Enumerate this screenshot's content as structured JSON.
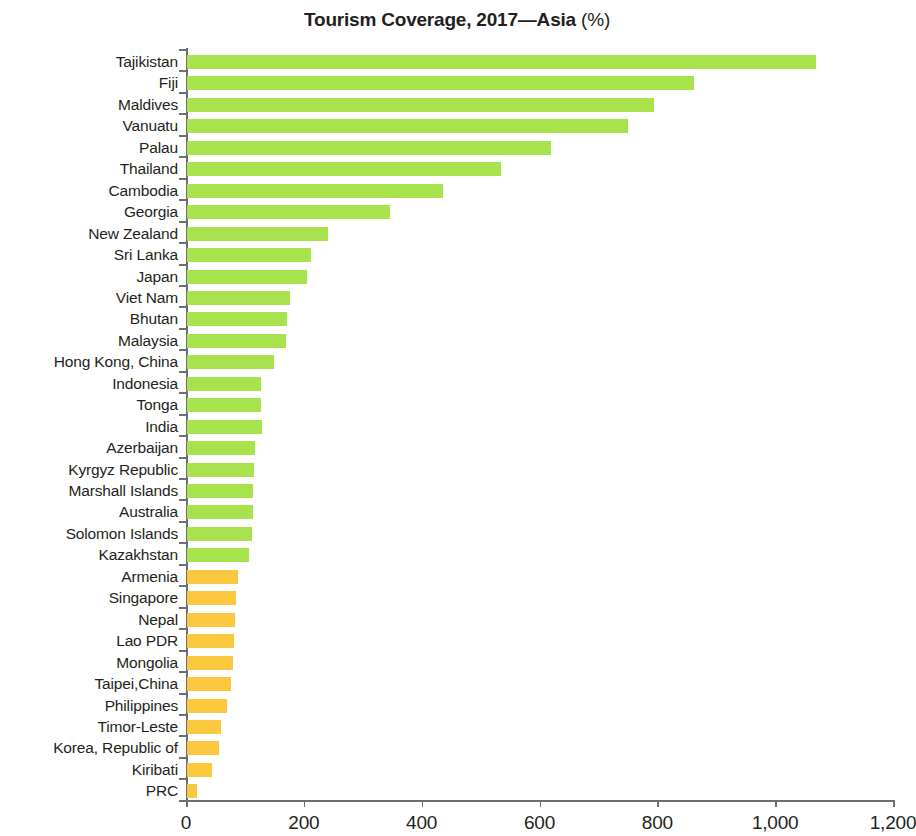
{
  "title": {
    "main": "Tourism Coverage, 2017—Asia",
    "unit": "(%)"
  },
  "colors": {
    "green": "#A8E24C",
    "orange": "#FBC73E",
    "axis": "#6D6E71",
    "text": "#231F20"
  },
  "axis": {
    "x_ticks": [
      "0",
      "200",
      "400",
      "600",
      "800",
      "1,000",
      "1,200"
    ]
  },
  "chart_data": {
    "type": "bar",
    "orientation": "horizontal",
    "title": "Tourism Coverage, 2017—Asia (%)",
    "xlabel": "",
    "ylabel": "",
    "xlim": [
      0,
      1200
    ],
    "xticks": [
      0,
      200,
      400,
      600,
      800,
      1000,
      1200
    ],
    "grid": false,
    "legend": "none",
    "categories": [
      "Tajikistan",
      "Fiji",
      "Maldives",
      "Vanuatu",
      "Palau",
      "Thailand",
      "Cambodia",
      "Georgia",
      "New Zealand",
      "Sri Lanka",
      "Japan",
      "Viet Nam",
      "Bhutan",
      "Malaysia",
      "Hong Kong, China",
      "Indonesia",
      "Tonga",
      "India",
      "Azerbaijan",
      "Kyrgyz Republic",
      "Marshall Islands",
      "Australia",
      "Solomon Islands",
      "Kazakhstan",
      "Armenia",
      "Singapore",
      "Nepal",
      "Lao PDR",
      "Mongolia",
      "Taipei,China",
      "Philippines",
      "Timor-Leste",
      "Korea, Republic of",
      "Kiribati",
      "PRC"
    ],
    "values": [
      1068,
      860,
      792,
      748,
      618,
      533,
      434,
      345,
      239,
      211,
      204,
      174,
      170,
      168,
      148,
      126,
      126,
      127,
      115,
      114,
      112,
      112,
      110,
      105,
      87,
      83,
      82,
      80,
      78,
      75,
      68,
      57,
      54,
      42,
      17
    ],
    "bar_colors": [
      "#A8E24C",
      "#A8E24C",
      "#A8E24C",
      "#A8E24C",
      "#A8E24C",
      "#A8E24C",
      "#A8E24C",
      "#A8E24C",
      "#A8E24C",
      "#A8E24C",
      "#A8E24C",
      "#A8E24C",
      "#A8E24C",
      "#A8E24C",
      "#A8E24C",
      "#A8E24C",
      "#A8E24C",
      "#A8E24C",
      "#A8E24C",
      "#A8E24C",
      "#A8E24C",
      "#A8E24C",
      "#A8E24C",
      "#A8E24C",
      "#FBC73E",
      "#FBC73E",
      "#FBC73E",
      "#FBC73E",
      "#FBC73E",
      "#FBC73E",
      "#FBC73E",
      "#FBC73E",
      "#FBC73E",
      "#FBC73E",
      "#FBC73E"
    ]
  }
}
